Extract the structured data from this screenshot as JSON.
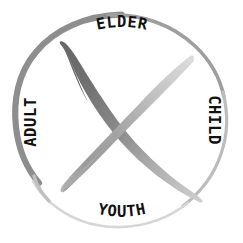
{
  "diagram": {
    "type": "life-stages-circle",
    "shape": "circle",
    "center": {
      "x": 121,
      "y": 121
    },
    "radius": 107,
    "colors": {
      "background": "#ffffff",
      "text": "#111111",
      "arc_top": "#9a9a9a",
      "arc_left": "#8f8f8f",
      "arc_right": "#bdbdbd",
      "arc_bottom": "#d8d8d8",
      "stroke_dark": "#6f6f6f",
      "stroke_mid": "#9d9d9d",
      "stroke_light": "#c9c9c9"
    },
    "labels": [
      {
        "id": "elder",
        "text": "ELDER",
        "position": "top",
        "rotation": 0,
        "x": 122,
        "y": 38
      },
      {
        "id": "child",
        "text": "CHILD",
        "position": "right",
        "rotation": 90,
        "x": 213,
        "y": 120
      },
      {
        "id": "youth",
        "text": "YOUTH",
        "position": "bottom",
        "rotation": 0,
        "x": 122,
        "y": 216
      },
      {
        "id": "adult",
        "text": "ADULT",
        "position": "left",
        "rotation": -90,
        "x": 31,
        "y": 122
      }
    ],
    "strokes": [
      {
        "id": "stroke-elder-youth",
        "description": "brush stroke from upper-left to lower-right",
        "from": "upper-left",
        "to": "lower-right",
        "shade": "dark-to-light"
      },
      {
        "id": "stroke-child-adult",
        "description": "brush stroke from upper-right to lower-left",
        "from": "upper-right",
        "to": "lower-left",
        "shade": "light-to-mid"
      }
    ]
  }
}
